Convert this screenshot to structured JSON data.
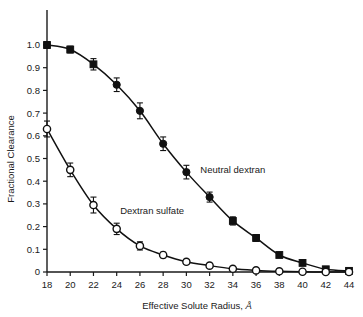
{
  "chart_data": {
    "type": "line",
    "title": "",
    "xlabel": "Effective Solute Radius, Å",
    "ylabel": "Fractional Clearance",
    "xlim": [
      18,
      44
    ],
    "ylim": [
      0,
      1.05
    ],
    "grid": false,
    "legend_position": "inline-annotations",
    "x": [
      18,
      20,
      22,
      24,
      26,
      28,
      30,
      32,
      34,
      36,
      38,
      40,
      42,
      44
    ],
    "xticklabels": [
      "18",
      "20",
      "22",
      "24",
      "26",
      "28",
      "30",
      "32",
      "34",
      "36",
      "38",
      "40",
      "42",
      "44"
    ],
    "yticks": [
      0,
      0.1,
      0.2,
      0.3,
      0.4,
      0.5,
      0.6,
      0.7,
      0.8,
      0.9,
      1.0
    ],
    "yticklabels": [
      "0",
      "0.1",
      "0.2",
      "0.3",
      "0.4",
      "0.5",
      "0.6",
      "0.7",
      "0.8",
      "0.9",
      "1.0"
    ],
    "series": [
      {
        "name": "Neutral dextran",
        "marker": "filled-square",
        "label_x": 31.2,
        "label_y": 0.435,
        "values": [
          1.0,
          0.98,
          0.915,
          0.825,
          0.71,
          0.565,
          0.44,
          0.33,
          0.225,
          0.15,
          0.075,
          0.04,
          0.012,
          0.005
        ],
        "err_low": [
          0.015,
          0.015,
          0.025,
          0.03,
          0.035,
          0.03,
          0.03,
          0.022,
          0.018,
          0.015,
          0.01,
          0.008,
          0.005,
          0.004
        ],
        "err_high": [
          0.015,
          0.015,
          0.025,
          0.03,
          0.035,
          0.03,
          0.03,
          0.022,
          0.018,
          0.015,
          0.01,
          0.008,
          0.005,
          0.004
        ]
      },
      {
        "name": "Dextran sulfate",
        "marker": "open-circle",
        "label_x": 24.3,
        "label_y": 0.255,
        "values": [
          0.63,
          0.45,
          0.295,
          0.19,
          0.115,
          0.075,
          0.045,
          0.028,
          0.014,
          0.007,
          0.003,
          0.001,
          0.0,
          0.0
        ],
        "err_low": [
          0.035,
          0.03,
          0.035,
          0.025,
          0.018,
          0.012,
          0.01,
          0.008,
          0.006,
          0.004,
          0.003,
          0.002,
          0.002,
          0.002
        ],
        "err_high": [
          0.035,
          0.03,
          0.035,
          0.025,
          0.018,
          0.012,
          0.01,
          0.008,
          0.006,
          0.004,
          0.003,
          0.002,
          0.002,
          0.002
        ]
      }
    ],
    "colors": {
      "axis": "#1a1a1a",
      "neutral_dextran": "#111111",
      "dextran_sulfate": "#111111",
      "background": "#ffffff"
    }
  }
}
